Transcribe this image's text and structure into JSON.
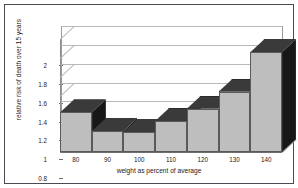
{
  "chart_data": {
    "type": "bar",
    "title": "",
    "subtitle": "",
    "xlabel": "weight as percent of average",
    "ylabel": "relative risk of death over 15 years",
    "categories": [
      "80",
      "90",
      "100",
      "110",
      "120",
      "130",
      "140"
    ],
    "values": [
      1.22,
      1.02,
      1.01,
      1.13,
      1.26,
      1.44,
      1.86
    ],
    "series": [
      {
        "name": "relative risk of death",
        "values": [
          1.22,
          1.02,
          1.01,
          1.13,
          1.26,
          1.44,
          1.86
        ]
      }
    ],
    "ylim": [
      0.8,
      2.0
    ],
    "yticks": [
      "0.8",
      "1",
      "1.2",
      "1.4",
      "1.6",
      "1.8",
      "2"
    ],
    "ytick_values": [
      0.8,
      1.0,
      1.2,
      1.4,
      1.6,
      1.8,
      2.0
    ],
    "xticks": [
      "80",
      "90",
      "100",
      "110",
      "120",
      "130",
      "140"
    ],
    "grid": "horizontal",
    "legend": "none",
    "style": "3d-bar",
    "colors": {
      "bar_front": "#bebebe",
      "bar_side": "#171717",
      "bar_top": "#3a3a3a",
      "gridline": "#b9b9b9",
      "axis": "#6e6e6e",
      "frame_border": "#4a4a52",
      "background": "#ffffff",
      "text": "#1b1b1b"
    }
  }
}
